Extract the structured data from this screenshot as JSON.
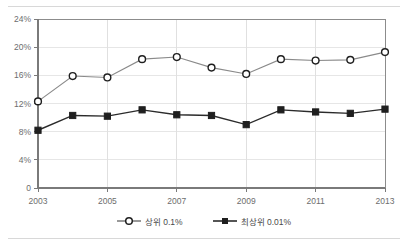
{
  "chart_data": {
    "type": "line",
    "title": "",
    "xlabel": "",
    "ylabel": "",
    "x": [
      2003,
      2004,
      2005,
      2006,
      2007,
      2008,
      2009,
      2010,
      2011,
      2012,
      2013
    ],
    "xlim": [
      2003,
      2013
    ],
    "ylim": [
      0,
      24
    ],
    "grid": true,
    "legend_position": "bottom-center",
    "x_tick_labels": [
      "2003",
      "2005",
      "2007",
      "2009",
      "2011",
      "2013"
    ],
    "x_tick_values": [
      2003,
      2005,
      2007,
      2009,
      2011,
      2013
    ],
    "y_tick_labels": [
      "0",
      "4%",
      "8%",
      "12%",
      "16%",
      "20%",
      "24%"
    ],
    "y_tick_values": [
      0,
      4,
      8,
      12,
      16,
      20,
      24
    ],
    "series": [
      {
        "name": "상위 0.1%",
        "marker": "open-circle",
        "values": [
          12.3,
          15.9,
          15.7,
          18.3,
          18.6,
          17.1,
          16.2,
          18.3,
          18.1,
          18.2,
          19.3
        ]
      },
      {
        "name": "최상위 0.01%",
        "marker": "filled-square",
        "values": [
          8.2,
          10.3,
          10.2,
          11.1,
          10.4,
          10.3,
          9.0,
          11.1,
          10.8,
          10.6,
          11.2
        ]
      }
    ]
  },
  "legend": {
    "entries": [
      {
        "label": "상위 0.1%",
        "marker": "open-circle"
      },
      {
        "label": "최상위 0.01%",
        "marker": "filled-square"
      }
    ]
  },
  "colors": {
    "series_open_line": "#8a8a8a",
    "series_filled_line": "#2b2b2b",
    "marker_stroke": "#1f1f1f",
    "grid": "#e6e6e6",
    "axis": "#7a7a7a",
    "tick_text": "#6d6d6d",
    "rule": "#d8d8d8",
    "background": "#ffffff"
  }
}
